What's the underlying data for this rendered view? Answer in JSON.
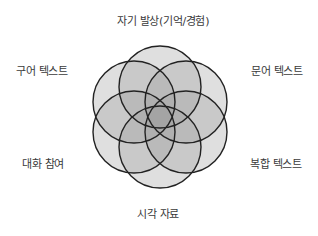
{
  "diagram": {
    "type": "six-circle-venn",
    "center": [
      160,
      117
    ],
    "radius": 41,
    "fill": "#9a9a9a",
    "fill_opacity": 0.32,
    "stroke": "#222222",
    "labels": {
      "top": "자기 발상(기억/경험)",
      "upper_left": "구어 텍스트",
      "upper_right": "문어 텍스트",
      "lower_left": "대화 참여",
      "lower_right": "복합 텍스트",
      "bottom": "시각 자료"
    },
    "circles": [
      {
        "name": "top",
        "cx": 160,
        "cy": 87
      },
      {
        "name": "upper-right",
        "cx": 186,
        "cy": 102
      },
      {
        "name": "lower-right",
        "cx": 186,
        "cy": 132
      },
      {
        "name": "bottom",
        "cx": 160,
        "cy": 147
      },
      {
        "name": "lower-left",
        "cx": 134,
        "cy": 132
      },
      {
        "name": "upper-left",
        "cx": 134,
        "cy": 102
      }
    ]
  }
}
